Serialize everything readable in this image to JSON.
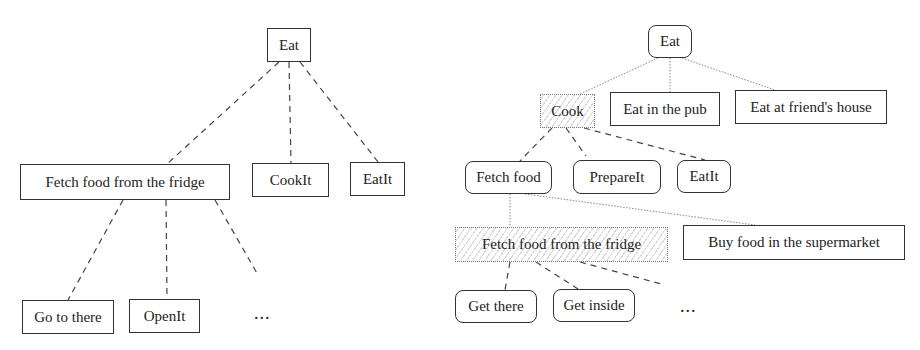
{
  "diagrams": [
    {
      "id": "left",
      "nodes": [
        {
          "key": "eat",
          "label": "Eat"
        },
        {
          "key": "fetch_fridge",
          "label": "Fetch food from the fridge"
        },
        {
          "key": "cookit",
          "label": "CookIt"
        },
        {
          "key": "eatit",
          "label": "EatIt"
        },
        {
          "key": "go_there",
          "label": "Go to there"
        },
        {
          "key": "openit",
          "label": "OpenIt"
        }
      ],
      "ellipsis": "...",
      "edges": [
        [
          "eat",
          "fetch_fridge"
        ],
        [
          "eat",
          "cookit"
        ],
        [
          "eat",
          "eatit"
        ],
        [
          "fetch_fridge",
          "go_there"
        ],
        [
          "fetch_fridge",
          "openit"
        ],
        [
          "fetch_fridge",
          "ellipsis"
        ]
      ]
    },
    {
      "id": "right",
      "nodes": [
        {
          "key": "eat",
          "label": "Eat"
        },
        {
          "key": "cook",
          "label": "Cook"
        },
        {
          "key": "eat_pub",
          "label": "Eat in the pub"
        },
        {
          "key": "eat_friend",
          "label": "Eat at friend's house"
        },
        {
          "key": "fetch_food",
          "label": "Fetch food"
        },
        {
          "key": "prepareit",
          "label": "PrepareIt"
        },
        {
          "key": "eatit",
          "label": "EatIt"
        },
        {
          "key": "fetch_fridge",
          "label": "Fetch food from the fridge"
        },
        {
          "key": "buy_supermarket",
          "label": "Buy food in the supermarket"
        },
        {
          "key": "get_there",
          "label": "Get there"
        },
        {
          "key": "get_inside",
          "label": "Get inside"
        }
      ],
      "ellipsis": "...",
      "edges": [
        [
          "eat",
          "cook"
        ],
        [
          "eat",
          "eat_pub"
        ],
        [
          "eat",
          "eat_friend"
        ],
        [
          "cook",
          "fetch_food"
        ],
        [
          "cook",
          "prepareit"
        ],
        [
          "cook",
          "eatit"
        ],
        [
          "fetch_food",
          "fetch_fridge"
        ],
        [
          "fetch_food",
          "buy_supermarket"
        ],
        [
          "fetch_fridge",
          "get_there"
        ],
        [
          "fetch_fridge",
          "get_inside"
        ],
        [
          "fetch_fridge",
          "ellipsis"
        ]
      ]
    }
  ]
}
